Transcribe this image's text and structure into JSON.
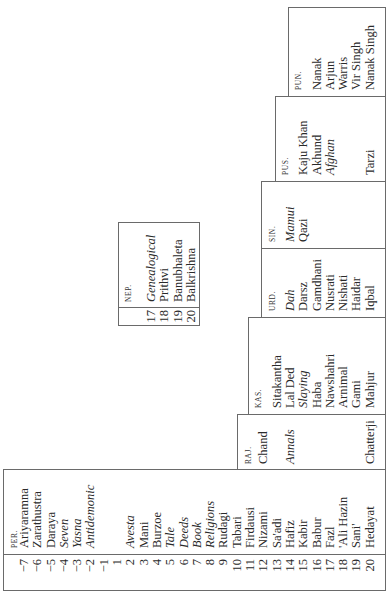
{
  "table": {
    "row_numbers": [
      "−7",
      "−6",
      "−5",
      "−4",
      "−3",
      "−2",
      "−1",
      "1",
      "2",
      "3",
      "4",
      "5",
      "6",
      "7",
      "8",
      "9",
      "10",
      "11",
      "12",
      "13",
      "14",
      "15",
      "16",
      "17",
      "18",
      "19",
      "20"
    ],
    "columns": {
      "per": {
        "header": "PER.",
        "rows": [
          {
            "n": "−7",
            "text": "Ariyaramna",
            "italic": false
          },
          {
            "n": "−6",
            "text": "Zarathustra",
            "italic": false
          },
          {
            "n": "−5",
            "text": "Daraya",
            "italic": false
          },
          {
            "n": "−4",
            "text": "Seven",
            "italic": true
          },
          {
            "n": "−3",
            "text": "Yasna",
            "italic": true
          },
          {
            "n": "−2",
            "text": "Antidemonic",
            "italic": true
          },
          {
            "n": "−1",
            "text": "",
            "italic": false
          },
          {
            "n": "1",
            "text": "",
            "italic": false
          },
          {
            "n": "2",
            "text": "Avesta",
            "italic": true
          },
          {
            "n": "3",
            "text": "Mani",
            "italic": false
          },
          {
            "n": "4",
            "text": "Burzoe",
            "italic": false
          },
          {
            "n": "5",
            "text": "Tale",
            "italic": true
          },
          {
            "n": "6",
            "text": "Deeds",
            "italic": true
          },
          {
            "n": "7",
            "text": "Book",
            "italic": true
          },
          {
            "n": "8",
            "text": "Religions",
            "italic": true
          },
          {
            "n": "9",
            "text": "Rudagi",
            "italic": false
          },
          {
            "n": "10",
            "text": "Tabari",
            "italic": false
          },
          {
            "n": "11",
            "text": "Firdausi",
            "italic": false
          },
          {
            "n": "12",
            "text": "Nizami",
            "italic": false
          },
          {
            "n": "13",
            "text": "Sa'adi",
            "italic": false
          },
          {
            "n": "14",
            "text": "Hafiz",
            "italic": false
          },
          {
            "n": "15",
            "text": "Kabir",
            "italic": false
          },
          {
            "n": "16",
            "text": "Babur",
            "italic": false
          },
          {
            "n": "17",
            "text": "Fazl",
            "italic": false
          },
          {
            "n": "18",
            "text": "'Ali Hazin",
            "italic": false
          },
          {
            "n": "19",
            "text": "Sani'",
            "italic": false
          },
          {
            "n": "20",
            "text": "Hedayat",
            "italic": false
          }
        ]
      },
      "raj": {
        "header": "RAJ.",
        "rows": [
          {
            "n": "12",
            "text": "Chand",
            "italic": false
          },
          {
            "n": "13",
            "text": "",
            "italic": false
          },
          {
            "n": "14",
            "text": "Annals",
            "italic": true
          },
          {
            "n": "15",
            "text": "",
            "italic": false
          },
          {
            "n": "16",
            "text": "",
            "italic": false
          },
          {
            "n": "17",
            "text": "",
            "italic": false
          },
          {
            "n": "18",
            "text": "",
            "italic": false
          },
          {
            "n": "19",
            "text": "",
            "italic": false
          },
          {
            "n": "20",
            "text": "Chatterji",
            "italic": false
          }
        ]
      },
      "kas": {
        "header": "KAS.",
        "rows": [
          {
            "n": "13",
            "text": "Sitakantha",
            "italic": false
          },
          {
            "n": "14",
            "text": "Lal Ded",
            "italic": false
          },
          {
            "n": "15",
            "text": "Slaying",
            "italic": true
          },
          {
            "n": "16",
            "text": "Haba",
            "italic": false
          },
          {
            "n": "17",
            "text": "Nawshahri",
            "italic": false
          },
          {
            "n": "18",
            "text": "Arnimal",
            "italic": false
          },
          {
            "n": "19",
            "text": "Gami",
            "italic": false
          },
          {
            "n": "20",
            "text": "Mahjur",
            "italic": false
          }
        ]
      },
      "nep": {
        "header": "NEP.",
        "rows": [
          {
            "n": "17",
            "text": "Genealogical",
            "italic": true
          },
          {
            "n": "18",
            "text": "Prithvi",
            "italic": false
          },
          {
            "n": "19",
            "text": "Banubhaleta",
            "italic": false
          },
          {
            "n": "20",
            "text": "Balkrishna",
            "italic": false
          }
        ]
      },
      "urd": {
        "header": "URD.",
        "rows": [
          {
            "n": "14",
            "text": "Dah",
            "italic": true
          },
          {
            "n": "15",
            "text": "Darsz",
            "italic": false
          },
          {
            "n": "16",
            "text": "Gamdhani",
            "italic": false
          },
          {
            "n": "17",
            "text": "Nusrati",
            "italic": false
          },
          {
            "n": "18",
            "text": "Nishati",
            "italic": false
          },
          {
            "n": "19",
            "text": "Haidar",
            "italic": false
          },
          {
            "n": "20",
            "text": "Iqbal",
            "italic": false
          }
        ]
      },
      "sin": {
        "header": "SIN.",
        "rows": [
          {
            "n": "14",
            "text": "Mamui",
            "italic": true
          },
          {
            "n": "15",
            "text": "Qazi",
            "italic": false
          }
        ]
      },
      "pus": {
        "header": "PUS.",
        "rows": [
          {
            "n": "15",
            "text": "Kaju Khan",
            "italic": false
          },
          {
            "n": "16",
            "text": "Akhund",
            "italic": false
          },
          {
            "n": "17",
            "text": "Afghan",
            "italic": true
          },
          {
            "n": "18",
            "text": "",
            "italic": false
          },
          {
            "n": "19",
            "text": "",
            "italic": false
          },
          {
            "n": "20",
            "text": "Tarzi",
            "italic": false
          }
        ]
      },
      "pun": {
        "header": "PUN.",
        "rows": [
          {
            "n": "16",
            "text": "Nanak",
            "italic": false
          },
          {
            "n": "17",
            "text": "Arjun",
            "italic": false
          },
          {
            "n": "18",
            "text": "Warris",
            "italic": false
          },
          {
            "n": "19",
            "text": "Vir Singh",
            "italic": false
          },
          {
            "n": "20",
            "text": "Nanak Singh",
            "italic": false
          }
        ]
      }
    }
  }
}
